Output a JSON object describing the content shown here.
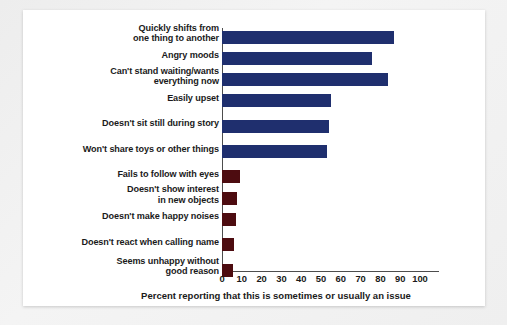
{
  "chart_data": {
    "type": "bar",
    "orientation": "horizontal",
    "title": "",
    "subtitle": "",
    "xlabel": "Percent reporting that this is sometimes or usually an issue",
    "ylabel": "",
    "xlim": [
      0,
      100
    ],
    "xticks": [
      "0",
      "10",
      "20",
      "30",
      "40",
      "50",
      "60",
      "70",
      "80",
      "90",
      "100"
    ],
    "grid": false,
    "legend": "none",
    "colors": {
      "group_one": "#1f2f6e",
      "group_two": "#4d0c10",
      "axis": "#4d4d4d",
      "text": "#1a1a1a",
      "panel_background": "#ffffff",
      "frame_background": "#f0f0f0"
    },
    "categories": [
      "Quickly shifts from one thing to another",
      "Angry moods",
      "Can't stand waiting/wants everything now",
      "Easily upset",
      "Doesn't sit still during story",
      "Won't share toys or other things",
      "Fails to follow with eyes",
      "Doesn't show interest in new objects",
      "Doesn't make happy noises",
      "Doesn't react when calling name",
      "Seems unhappy without good reason"
    ],
    "values": [
      87,
      76,
      84,
      55,
      54,
      53,
      9,
      7.5,
      7,
      6,
      5.5
    ],
    "bars": [
      {
        "label_lines": [
          "Quickly shifts from",
          "one thing to another"
        ],
        "value": 87,
        "color_group": "group_one"
      },
      {
        "label_lines": [
          "Angry moods"
        ],
        "value": 76,
        "color_group": "group_one"
      },
      {
        "label_lines": [
          "Can't stand waiting/wants",
          "everything now"
        ],
        "value": 84,
        "color_group": "group_one"
      },
      {
        "label_lines": [
          "Easily upset"
        ],
        "value": 55,
        "color_group": "group_one"
      },
      {
        "label_lines": [
          "Doesn't sit still during story"
        ],
        "value": 54,
        "color_group": "group_one"
      },
      {
        "label_lines": [
          "Won't share toys or other things"
        ],
        "value": 53,
        "color_group": "group_one"
      },
      {
        "label_lines": [
          "Fails to follow with eyes"
        ],
        "value": 9,
        "color_group": "group_two"
      },
      {
        "label_lines": [
          "Doesn't show interest",
          "in new objects"
        ],
        "value": 7.5,
        "color_group": "group_two"
      },
      {
        "label_lines": [
          "Doesn't make happy noises"
        ],
        "value": 7,
        "color_group": "group_two"
      },
      {
        "label_lines": [
          "Doesn't react when calling name"
        ],
        "value": 6,
        "color_group": "group_two"
      },
      {
        "label_lines": [
          "Seems unhappy without",
          "good reason"
        ],
        "value": 5.5,
        "color_group": "group_two"
      }
    ]
  }
}
